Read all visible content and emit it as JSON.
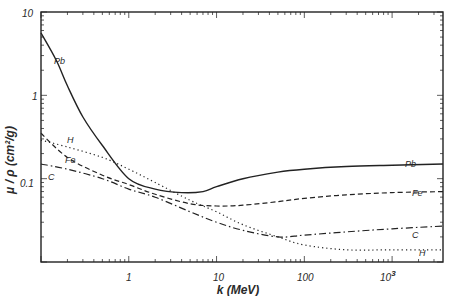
{
  "chart_data": {
    "type": "line",
    "title": "",
    "xlabel": "k (MeV)",
    "ylabel": "μ / ρ (cm²/g)",
    "xscale": "log",
    "yscale": "log",
    "xlim": [
      0.1,
      3800
    ],
    "ylim": [
      0.01,
      10
    ],
    "x_ticks": [
      "1",
      "10",
      "100",
      "10³"
    ],
    "y_ticks": [
      "10",
      "1",
      "0.1"
    ],
    "grid": false,
    "legend": "inline labels on curves",
    "series": [
      {
        "name": "Pb",
        "style": "solid",
        "points": [
          [
            0.1,
            5.6
          ],
          [
            0.15,
            2.6
          ],
          [
            0.2,
            1.3
          ],
          [
            0.3,
            0.55
          ],
          [
            0.5,
            0.25
          ],
          [
            1,
            0.1
          ],
          [
            2,
            0.075
          ],
          [
            4,
            0.068
          ],
          [
            7,
            0.07
          ],
          [
            10,
            0.08
          ],
          [
            20,
            0.1
          ],
          [
            50,
            0.12
          ],
          [
            100,
            0.13
          ],
          [
            300,
            0.14
          ],
          [
            1000,
            0.145
          ],
          [
            3800,
            0.15
          ]
        ]
      },
      {
        "name": "Fe",
        "style": "dashed",
        "points": [
          [
            0.1,
            0.35
          ],
          [
            0.2,
            0.18
          ],
          [
            0.5,
            0.11
          ],
          [
            1,
            0.085
          ],
          [
            2,
            0.065
          ],
          [
            5,
            0.05
          ],
          [
            10,
            0.047
          ],
          [
            20,
            0.048
          ],
          [
            50,
            0.053
          ],
          [
            100,
            0.058
          ],
          [
            300,
            0.064
          ],
          [
            1000,
            0.068
          ],
          [
            3800,
            0.07
          ]
        ]
      },
      {
        "name": "C",
        "style": "dash-dot",
        "points": [
          [
            0.1,
            0.15
          ],
          [
            0.2,
            0.13
          ],
          [
            0.5,
            0.1
          ],
          [
            1,
            0.075
          ],
          [
            2,
            0.06
          ],
          [
            5,
            0.04
          ],
          [
            10,
            0.03
          ],
          [
            20,
            0.024
          ],
          [
            50,
            0.02
          ],
          [
            100,
            0.021
          ],
          [
            300,
            0.023
          ],
          [
            1000,
            0.025
          ],
          [
            3800,
            0.027
          ]
        ]
      },
      {
        "name": "H",
        "style": "dotted",
        "points": [
          [
            0.1,
            0.29
          ],
          [
            0.2,
            0.24
          ],
          [
            0.5,
            0.18
          ],
          [
            1,
            0.13
          ],
          [
            2,
            0.09
          ],
          [
            5,
            0.055
          ],
          [
            10,
            0.04
          ],
          [
            20,
            0.028
          ],
          [
            50,
            0.02
          ],
          [
            100,
            0.016
          ],
          [
            300,
            0.014
          ],
          [
            1000,
            0.014
          ],
          [
            3800,
            0.014
          ]
        ]
      }
    ]
  },
  "labels": {
    "ylabel": "μ / ρ  (cm²/g)",
    "xlabel": "k   (MeV)",
    "series_pb_left": "Pb",
    "series_pb_right": "Pb",
    "series_h_left": "H",
    "series_h_right": "H",
    "series_fe_left": "Fe",
    "series_fe_right": "Fe",
    "series_c_left": "C",
    "series_c_right": "C",
    "ytick_10": "10",
    "ytick_1": "1",
    "ytick_01": "0.1",
    "xtick_1": "1",
    "xtick_10": "10",
    "xtick_100": "100",
    "xtick_1000_base": "10",
    "xtick_1000_exp": "3"
  }
}
